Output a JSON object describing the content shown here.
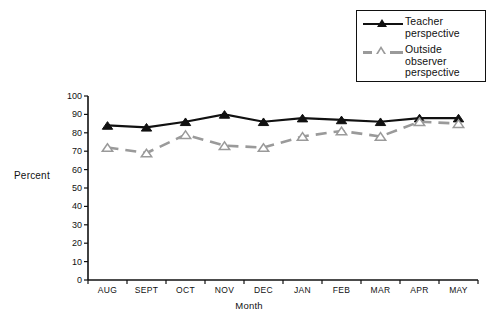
{
  "chart_data": {
    "type": "line",
    "title": "",
    "xlabel": "Month",
    "ylabel": "Percent",
    "categories": [
      "AUG",
      "SEPT",
      "OCT",
      "NOV",
      "DEC",
      "JAN",
      "FEB",
      "MAR",
      "APR",
      "MAY"
    ],
    "ylim": [
      0,
      100
    ],
    "ytick_labels": [
      "0",
      "10",
      "20",
      "30",
      "40",
      "50",
      "60",
      "70",
      "80",
      "90",
      "100"
    ],
    "ytick_values": [
      0,
      10,
      20,
      30,
      40,
      50,
      60,
      70,
      80,
      90,
      100
    ],
    "grid": false,
    "legend_position": "top-right",
    "series": [
      {
        "name": "Teacher perspective",
        "values": [
          84,
          83,
          86,
          90,
          86,
          88,
          87,
          86,
          88,
          88
        ],
        "color": "#111111",
        "line_style": "solid",
        "marker": "triangle-filled"
      },
      {
        "name": "Outside observer perspective",
        "values": [
          72,
          69,
          79,
          73,
          72,
          78,
          81,
          78,
          86,
          85
        ],
        "color": "#9a9a9a",
        "line_style": "dashed",
        "marker": "triangle-open"
      }
    ]
  },
  "legend": {
    "entries": [
      {
        "label_line1": "Teacher",
        "label_line2": "perspective"
      },
      {
        "label_line1": "Outside",
        "label_line2": "observer",
        "label_line3": "perspective"
      }
    ]
  }
}
